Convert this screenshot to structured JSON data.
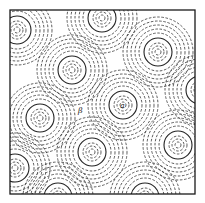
{
  "figure": {
    "frame": {
      "x": 10,
      "y": 10,
      "width": 185,
      "height": 184
    },
    "labels": [
      {
        "text": "a",
        "x": 120,
        "y": 108
      },
      {
        "text": "β",
        "x": 78,
        "y": 113
      }
    ],
    "colors": {
      "line": "#222222",
      "background": "#ffffff"
    },
    "circles": [
      {
        "cx": 17,
        "cy": 30
      },
      {
        "cx": 102,
        "cy": 18
      },
      {
        "cx": 158,
        "cy": 52
      },
      {
        "cx": 72,
        "cy": 70
      },
      {
        "cx": 123,
        "cy": 105
      },
      {
        "cx": 40,
        "cy": 118
      },
      {
        "cx": 200,
        "cy": 90
      },
      {
        "cx": 92,
        "cy": 152
      },
      {
        "cx": 178,
        "cy": 145
      },
      {
        "cx": 15,
        "cy": 168
      },
      {
        "cx": 58,
        "cy": 197
      },
      {
        "cx": 145,
        "cy": 197
      }
    ],
    "ring_pattern": {
      "inner_dashed_radii": [
        3,
        6,
        9
      ],
      "solid_radius": 14,
      "outer_dashed_radii": [
        19,
        23,
        27,
        31,
        35
      ]
    }
  }
}
